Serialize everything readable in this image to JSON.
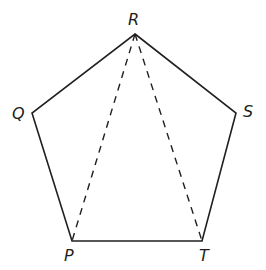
{
  "diagram": {
    "type": "regular-pentagon",
    "colors": {
      "stroke": "#231f20",
      "background": "#ffffff"
    },
    "vertices": [
      {
        "name": "R",
        "label": "R",
        "x": 135,
        "y": 34
      },
      {
        "name": "S",
        "label": "S",
        "x": 236,
        "y": 113
      },
      {
        "name": "T",
        "label": "T",
        "x": 202,
        "y": 241
      },
      {
        "name": "P",
        "label": "P",
        "x": 72,
        "y": 241
      },
      {
        "name": "Q",
        "label": "Q",
        "x": 32,
        "y": 113
      }
    ],
    "edges": [
      {
        "from": "R",
        "to": "S",
        "style": "solid"
      },
      {
        "from": "S",
        "to": "T",
        "style": "solid"
      },
      {
        "from": "T",
        "to": "P",
        "style": "solid"
      },
      {
        "from": "P",
        "to": "Q",
        "style": "solid"
      },
      {
        "from": "Q",
        "to": "R",
        "style": "solid"
      }
    ],
    "diagonals": [
      {
        "from": "R",
        "to": "P",
        "style": "dashed"
      },
      {
        "from": "R",
        "to": "T",
        "style": "dashed"
      }
    ],
    "labels": {
      "R": "R",
      "Q": "Q",
      "S": "S",
      "P": "P",
      "T": "T"
    }
  }
}
